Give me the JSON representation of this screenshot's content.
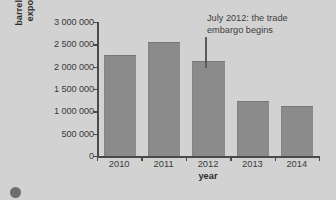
{
  "chart_data": {
    "type": "bar",
    "title": "",
    "xlabel": "year",
    "ylabel": "barrels of crude oil exported per day",
    "ylabel_lines": [
      "barrels of crude oil",
      "exported per day"
    ],
    "categories": [
      "2010",
      "2011",
      "2012",
      "2013",
      "2014"
    ],
    "values": [
      2250000,
      2540000,
      2110000,
      1220000,
      1100000
    ],
    "ylim": [
      0,
      3000000
    ],
    "ytick_values": [
      0,
      500000,
      1000000,
      1500000,
      2000000,
      2500000,
      3000000
    ],
    "ytick_labels": [
      "0",
      "500 000",
      "1 000 000",
      "1 500 000",
      "2 000 000",
      "2 500 000",
      "3 000 000"
    ],
    "grid": false,
    "legend": null,
    "bar_color": "#8b8b8b",
    "background_color": "#d2d2d2",
    "axis_color": "#4a4a4a",
    "annotations": [
      {
        "text": "July 2012: the trade embargo begins",
        "lines": [
          "July 2012: the trade",
          "embargo begins"
        ],
        "points_to_category": "2012",
        "leader_line": true
      }
    ]
  },
  "caption": {
    "text": "",
    "badge": "info-badge"
  }
}
